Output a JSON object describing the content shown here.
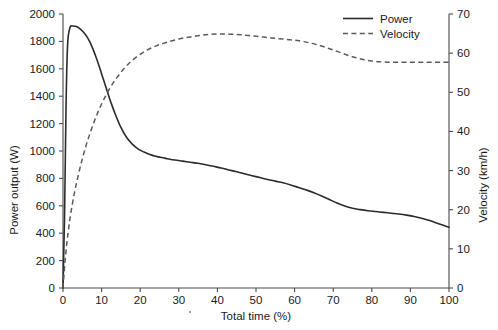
{
  "chart_data": {
    "type": "line",
    "title": "",
    "xlabel": "Total time (%)",
    "ylabel": "Power output (W)",
    "y2label": "Velocity (km/h)",
    "xlim": [
      0,
      100
    ],
    "ylim": [
      0,
      2000
    ],
    "y2lim": [
      0,
      70
    ],
    "grid": false,
    "legend_position": "top-right",
    "xticks": [
      0,
      10,
      20,
      30,
      40,
      50,
      60,
      70,
      80,
      90,
      100
    ],
    "xtick_labels": [
      "0",
      "10",
      "20",
      "30",
      "40",
      "50",
      "60",
      "70",
      "80",
      "90",
      "100"
    ],
    "yticks": [
      0,
      200,
      400,
      600,
      800,
      1000,
      1200,
      1400,
      1600,
      1800,
      2000
    ],
    "ytick_labels": [
      "0",
      "200",
      "400",
      "600",
      "800",
      "1000",
      "1200",
      "1400",
      "1600",
      "1800",
      "2000"
    ],
    "y2ticks": [
      0,
      10,
      20,
      30,
      40,
      50,
      60,
      70
    ],
    "y2tick_labels": [
      "0",
      "10",
      "20",
      "30",
      "40",
      "50",
      "60",
      "70"
    ],
    "series": [
      {
        "name": "Power",
        "axis": "left",
        "style": "solid",
        "color": "#2b2b2b",
        "unit": "W",
        "x": [
          0,
          0.4,
          0.8,
          1.2,
          1.8,
          2.5,
          3.5,
          4.5,
          5.5,
          6.5,
          7.5,
          8.5,
          9.5,
          10.5,
          11.5,
          12.5,
          13.5,
          15,
          16.5,
          18,
          19.5,
          21,
          22.5,
          24,
          25.5,
          27,
          29,
          31,
          33,
          35,
          37,
          39,
          41,
          43,
          45,
          47,
          49,
          51,
          53,
          55,
          57,
          59,
          61,
          63,
          65,
          67,
          69,
          71,
          73,
          75,
          77,
          79,
          81,
          83,
          85,
          87,
          89,
          91,
          93,
          95,
          97,
          99,
          100
        ],
        "y": [
          0,
          520,
          1350,
          1780,
          1900,
          1912,
          1908,
          1890,
          1862,
          1820,
          1762,
          1690,
          1608,
          1520,
          1432,
          1348,
          1272,
          1172,
          1098,
          1048,
          1014,
          992,
          975,
          962,
          952,
          944,
          934,
          926,
          918,
          910,
          900,
          888,
          876,
          862,
          848,
          834,
          820,
          806,
          792,
          780,
          768,
          752,
          734,
          716,
          696,
          672,
          646,
          620,
          598,
          582,
          572,
          564,
          558,
          552,
          546,
          540,
          532,
          522,
          508,
          492,
          472,
          452,
          444
        ]
      },
      {
        "name": "Velocity",
        "axis": "right",
        "style": "dashed",
        "color": "#5a5a5a",
        "unit": "km/h",
        "x": [
          0,
          0.5,
          1,
          1.5,
          2,
          3,
          4,
          5,
          6,
          7,
          8,
          9,
          10,
          11,
          12,
          13,
          14,
          15,
          16,
          17,
          18,
          20,
          22,
          24,
          26,
          28,
          30,
          32,
          34,
          36,
          38,
          40,
          42,
          44,
          46,
          48,
          50,
          52,
          54,
          56,
          58,
          60,
          62,
          64,
          66,
          68,
          70,
          72,
          74,
          76,
          78,
          80,
          82,
          84,
          86,
          88,
          90,
          92,
          94,
          96,
          98,
          100
        ],
        "y": [
          0,
          6.5,
          11.5,
          15.5,
          19,
          24.5,
          29,
          33,
          36.5,
          39.5,
          42.3,
          44.8,
          47,
          49,
          50.8,
          52.4,
          53.8,
          55.1,
          56.3,
          57.3,
          58.2,
          59.7,
          60.9,
          61.8,
          62.5,
          63.1,
          63.6,
          64,
          64.3,
          64.6,
          64.8,
          64.9,
          64.9,
          64.8,
          64.7,
          64.5,
          64.3,
          64.1,
          63.9,
          63.7,
          63.5,
          63.3,
          63,
          62.6,
          62.1,
          61.5,
          60.8,
          60.1,
          59.4,
          58.8,
          58.3,
          58,
          57.8,
          57.7,
          57.7,
          57.7,
          57.7,
          57.7,
          57.7,
          57.7,
          57.7,
          57.7
        ]
      }
    ],
    "legend": [
      {
        "label": "Power",
        "style": "solid"
      },
      {
        "label": "Velocity",
        "style": "dashed"
      }
    ]
  },
  "axes": {
    "x_title": "Total time (%)",
    "y_left_title": "Power output (W)",
    "y_right_title": "Velocity (km/h)"
  },
  "legend": {
    "power_label": "Power",
    "velocity_label": "Velocity"
  },
  "colors": {
    "power": "#2b2b2b",
    "velocity": "#5a5a5a",
    "axis": "#4a4a4a",
    "text": "#1a1a1a",
    "background": "#ffffff"
  }
}
